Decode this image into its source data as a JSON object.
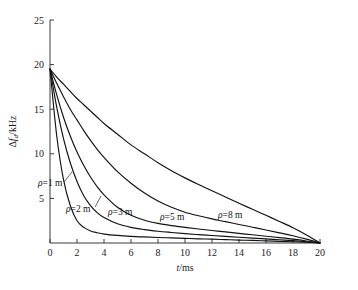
{
  "figure": {
    "background_color": "#ffffff",
    "curve_color": "#111111",
    "axis_color": "#3a3a3a"
  },
  "axes": {
    "x_title": "t/ms",
    "y_title": "Δf_d/kHz",
    "y_title_parts": {
      "delta": "Δ",
      "symbol": "f",
      "sub": "d",
      "unit": "/kHz"
    },
    "x_ticks": [
      "0",
      "2",
      "4",
      "6",
      "8",
      "10",
      "12",
      "14",
      "16",
      "18",
      "20"
    ],
    "y_ticks": [
      "5",
      "10",
      "15",
      "20",
      "25"
    ]
  },
  "curve_labels": [
    {
      "id": "rho-1",
      "text": "ρ=1 m",
      "rho": 1
    },
    {
      "id": "rho-2",
      "text": "ρ=2 m",
      "rho": 2
    },
    {
      "id": "rho-3",
      "text": "ρ=3 m",
      "rho": 3
    },
    {
      "id": "rho-5",
      "text": "ρ=5 m",
      "rho": 5
    },
    {
      "id": "rho-8",
      "text": "ρ=8 m",
      "rho": 8
    }
  ],
  "chart_data": {
    "type": "line",
    "title": "",
    "xlabel": "t/ms",
    "ylabel": "Δf_d/kHz",
    "xlim": [
      0,
      20
    ],
    "ylim": [
      0,
      25
    ],
    "xticks": [
      0,
      2,
      4,
      6,
      8,
      10,
      12,
      14,
      16,
      18,
      20
    ],
    "yticks": [
      5,
      10,
      15,
      20,
      25
    ],
    "grid": false,
    "legend": "inline-curve-labels",
    "x": [
      0,
      0.5,
      1,
      1.5,
      2,
      2.5,
      3,
      3.5,
      4,
      5,
      6,
      7,
      8,
      9,
      10,
      11,
      12,
      13,
      14,
      15,
      16,
      17,
      18,
      19,
      20
    ],
    "series": [
      {
        "name": "ρ=1 m",
        "rho": 1,
        "values": [
          19.5,
          12.0,
          7.1,
          4.2,
          2.5,
          1.75,
          1.35,
          1.15,
          1.0,
          0.85,
          0.75,
          0.68,
          0.62,
          0.57,
          0.52,
          0.47,
          0.43,
          0.38,
          0.33,
          0.29,
          0.24,
          0.19,
          0.14,
          0.08,
          0.0
        ]
      },
      {
        "name": "ρ=2 m",
        "rho": 2,
        "values": [
          19.5,
          15.2,
          11.7,
          9.0,
          6.9,
          5.3,
          4.2,
          3.4,
          2.85,
          2.15,
          1.75,
          1.5,
          1.32,
          1.18,
          1.05,
          0.94,
          0.84,
          0.74,
          0.64,
          0.55,
          0.46,
          0.36,
          0.26,
          0.14,
          0.0
        ]
      },
      {
        "name": "ρ=3 m",
        "rho": 3,
        "values": [
          19.5,
          16.6,
          14.1,
          12.0,
          10.2,
          8.7,
          7.4,
          6.3,
          5.4,
          4.0,
          3.1,
          2.55,
          2.2,
          1.95,
          1.75,
          1.57,
          1.4,
          1.24,
          1.08,
          0.92,
          0.76,
          0.6,
          0.43,
          0.23,
          0.0
        ]
      },
      {
        "name": "ρ=5 m",
        "rho": 5,
        "values": [
          19.5,
          17.9,
          16.4,
          15.0,
          13.8,
          12.6,
          11.5,
          10.5,
          9.6,
          8.0,
          6.7,
          5.6,
          4.7,
          4.0,
          3.45,
          3.05,
          2.7,
          2.4,
          2.08,
          1.77,
          1.46,
          1.14,
          0.81,
          0.43,
          0.0
        ]
      },
      {
        "name": "ρ=8 m",
        "rho": 8,
        "values": [
          19.5,
          18.6,
          17.8,
          17.0,
          16.2,
          15.5,
          14.8,
          14.1,
          13.4,
          12.2,
          11.0,
          10.0,
          9.0,
          8.1,
          7.3,
          6.55,
          5.85,
          5.15,
          4.45,
          3.78,
          3.1,
          2.42,
          1.72,
          0.91,
          0.0
        ]
      }
    ]
  }
}
